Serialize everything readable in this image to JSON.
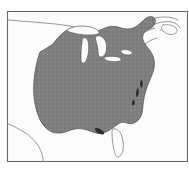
{
  "figure": {
    "kind": "range-distribution-map",
    "region_label": "Eastern North America",
    "frame": {
      "x": 7,
      "y": 11,
      "width": 181,
      "height": 151,
      "border_color": "#6a6a6a",
      "background_color": "#fcfcfc"
    },
    "colors": {
      "range_fill": "#7f7f7f",
      "range_outline": "#4a4a4a",
      "coastline": "#8d8d8d",
      "lake_fill": "#fbfbfb",
      "bay_shadow": "#2c2c2c",
      "page_background": "#ffffff"
    }
  },
  "legend": {
    "shaded_meaning": "Shaded area indicates species range",
    "unshaded_meaning": "Unshaded area outside range"
  },
  "features": {
    "range_polygon_name": "eastern-us-shaded-range",
    "lakes": [
      {
        "name": "Lake Superior",
        "shaded": false
      },
      {
        "name": "Lake Michigan",
        "shaded": false
      },
      {
        "name": "Lake Huron",
        "shaded": false
      },
      {
        "name": "Lake Erie",
        "shaded": false
      },
      {
        "name": "Lake Ontario",
        "shaded": false
      }
    ],
    "unshaded_landforms": [
      {
        "name": "Florida Peninsula",
        "shaded": false
      },
      {
        "name": "Texas Gulf Coast",
        "shaded": false
      },
      {
        "name": "Nova Scotia",
        "shaded": false
      },
      {
        "name": "Gulf of St. Lawrence Coast",
        "shaded": false
      },
      {
        "name": "Northern Plains / Canada Border",
        "shaded": false
      }
    ],
    "coastal_indentations": [
      {
        "name": "Chesapeake Bay"
      },
      {
        "name": "Delaware Bay"
      },
      {
        "name": "Long Island Sound"
      }
    ]
  },
  "geometry": {
    "range_path": "M 40 52 C 37 60 35 70 34 80 C 33 92 34 102 37 112 C 40 122 45 129 52 132 C 58 134 63 133 68 131 C 73 129 78 128 83 129 C 88 130 92 132 96 133 C 100 134 104 133 108 131 C 112 129 115 126 118 124 C 121 122 124 122 127 123 C 130 124 133 124 136 122 C 139 120 141 117 142 113 C 143 108 143 103 144 98 C 145 92 147 87 149 82 C 151 77 153 73 154 68 C 155 63 154 58 152 54 C 150 50 147 47 145 44 C 143 41 142 38 143 35 C 144 32 146 30 149 29 C 152 28 154 26 155 23 C 156 20 155 18 153 17 C 150 16 147 17 145 19 C 142 21 140 24 137 26 C 134 28 131 29 128 29 C 124 29 121 28 118 27 C 114 26 111 26 108 27 C 104 28 101 30 97 31 C 93 32 89 32 85 31 C 81 30 78 28 74 28 C 70 28 66 30 63 33 C 59 36 56 40 53 44 C 49 47 45 49 40 52 Z",
    "lake_superior_path": "M 68 29 C 72 27 77 26 82 26 C 87 26 92 27 96 29 C 99 31 100 33 98 34 C 95 35 91 35 87 35 C 82 35 77 34 73 33 C 69 32 66 31 68 29 Z",
    "lake_michigan_path": "M 83 38 C 85 37 87 38 88 41 C 89 45 89 50 88 55 C 87 59 86 62 84 63 C 82 64 81 62 81 58 C 81 53 81 47 82 43 C 82 40 82 39 83 38 Z",
    "lake_huron_path": "M 97 36 C 100 35 103 37 105 40 C 107 44 107 48 106 52 C 105 55 103 57 101 57 C 99 57 98 55 98 52 C 98 48 97 44 96 41 C 95 38 95 37 97 36 Z",
    "lake_erie_path": "M 105 57 C 109 56 114 56 118 57 C 121 58 122 60 120 61 C 117 62 112 62 108 61 C 105 60 103 58 105 57 Z",
    "lake_ontario_path": "M 122 50 C 126 49 130 50 132 52 C 133 54 131 55 128 55 C 125 55 122 54 121 52 C 120 51 121 50 122 50 Z",
    "florida_path": "M 113 129 C 116 128 119 130 121 134 C 123 139 124 145 123 150 C 122 154 120 157 118 157 C 116 157 115 154 114 150 C 113 145 112 139 112 134 C 112 131 112 130 113 129 Z",
    "texas_coast_path": "M 8 124 C 14 126 19 129 24 132 C 29 135 33 139 37 144 C 40 148 42 153 43 158 C 43 160 43 161 43 162",
    "canada_border_path": "M 8 20 C 20 21 33 22 45 23 C 56 24 66 25 74 27",
    "stlawrence_path": "M 148 20 C 153 18 159 17 165 17 C 170 17 175 18 178 20 M 155 24 C 160 22 166 21 172 22 C 176 23 179 25 180 28 M 160 30 C 166 29 172 30 176 33",
    "nova_scotia_path": "M 163 25 C 168 24 173 25 176 28 C 178 30 177 33 174 34 C 170 35 166 34 163 31 C 161 29 161 26 163 25 Z",
    "maine_coast_path": "M 143 33 C 147 31 151 29 155 28 M 145 44 C 149 41 153 39 157 38",
    "chesapeake_notches": [
      {
        "path": "M 138 88 C 139 90 139 93 138 96 C 137 98 136 97 136 94 C 136 91 137 89 138 88 Z"
      },
      {
        "path": "M 142 80 C 143 82 143 85 142 87 C 141 88 140 87 140 84 C 140 82 141 80 142 80 Z"
      },
      {
        "path": "M 134 100 C 135 102 135 104 134 105 C 133 106 132 105 132 103 C 132 101 133 100 134 100 Z"
      }
    ],
    "gulf_coast_notch_path": "M 96 128 C 99 128 102 130 104 132 C 105 134 103 135 100 134 C 97 133 95 131 95 129 C 95 128 95 128 96 128 Z"
  }
}
